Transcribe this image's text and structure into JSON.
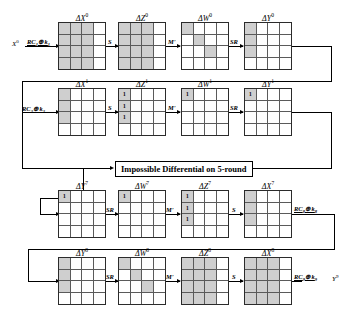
{
  "diagram": {
    "banner": "Impossible Differential on 5-round",
    "cell_mark": "1",
    "colors": {
      "active_cell": "#cfcfcf",
      "line": "#000000",
      "border": "#2b2b2b"
    },
    "rows": [
      {
        "id": "round-0",
        "input_label": "X",
        "input_sup": "0",
        "input_op": "RC",
        "input_op_sub": "1",
        "input_op_rest": "⊕ k",
        "input_op_sub2": "1",
        "states": [
          {
            "name": "delta-x-0",
            "label": "ΔX",
            "sup": "0",
            "cells": [
              [
                1,
                1,
                1,
                0
              ],
              [
                1,
                1,
                1,
                0
              ],
              [
                1,
                1,
                1,
                0
              ],
              [
                1,
                1,
                1,
                0
              ]
            ],
            "marks": [
              [
                "",
                "",
                "",
                ""
              ],
              [
                "",
                "",
                "",
                ""
              ],
              [
                "",
                "",
                "",
                ""
              ],
              [
                "",
                "",
                "",
                ""
              ]
            ]
          },
          {
            "name": "delta-z-0",
            "label": "ΔZ",
            "sup": "0",
            "cells": [
              [
                1,
                1,
                1,
                0
              ],
              [
                1,
                1,
                1,
                0
              ],
              [
                1,
                1,
                1,
                0
              ],
              [
                1,
                1,
                1,
                0
              ]
            ],
            "marks": [
              [
                "",
                "",
                "",
                ""
              ],
              [
                "",
                "",
                "",
                ""
              ],
              [
                "",
                "",
                "",
                ""
              ],
              [
                "",
                "",
                "",
                ""
              ]
            ]
          },
          {
            "name": "delta-w-0",
            "label": "ΔW",
            "sup": "0",
            "cells": [
              [
                1,
                0,
                0,
                0
              ],
              [
                0,
                1,
                0,
                0
              ],
              [
                0,
                0,
                1,
                0
              ],
              [
                0,
                0,
                0,
                0
              ]
            ],
            "marks": [
              [
                "",
                "",
                "",
                ""
              ],
              [
                "",
                "",
                "",
                ""
              ],
              [
                "",
                "",
                "",
                ""
              ],
              [
                "",
                "",
                "",
                ""
              ]
            ]
          },
          {
            "name": "delta-y-0",
            "label": "ΔY",
            "sup": "0",
            "cells": [
              [
                1,
                0,
                0,
                0
              ],
              [
                1,
                0,
                0,
                0
              ],
              [
                1,
                0,
                0,
                0
              ],
              [
                0,
                0,
                0,
                0
              ]
            ],
            "marks": [
              [
                "",
                "",
                "",
                ""
              ],
              [
                "",
                "",
                "",
                ""
              ],
              [
                "",
                "",
                "",
                ""
              ],
              [
                "",
                "",
                "",
                ""
              ]
            ]
          }
        ],
        "ops": [
          "S",
          "M'",
          "SR"
        ]
      },
      {
        "id": "round-1",
        "input_label": "",
        "input_sup": "",
        "input_op": "RC",
        "input_op_sub": "2",
        "input_op_rest": "⊕ k",
        "input_op_sub2": "2",
        "states": [
          {
            "name": "delta-x-1",
            "label": "ΔX",
            "sup": "1",
            "cells": [
              [
                1,
                0,
                0,
                0
              ],
              [
                1,
                0,
                0,
                0
              ],
              [
                1,
                0,
                0,
                0
              ],
              [
                0,
                0,
                0,
                0
              ]
            ],
            "marks": [
              [
                "",
                "",
                "",
                ""
              ],
              [
                "",
                "",
                "",
                ""
              ],
              [
                "",
                "",
                "",
                ""
              ],
              [
                "",
                "",
                "",
                ""
              ]
            ]
          },
          {
            "name": "delta-z-1",
            "label": "ΔZ",
            "sup": "1",
            "cells": [
              [
                1,
                0,
                0,
                0
              ],
              [
                1,
                0,
                0,
                0
              ],
              [
                1,
                0,
                0,
                0
              ],
              [
                0,
                0,
                0,
                0
              ]
            ],
            "marks": [
              [
                "1",
                "",
                "",
                ""
              ],
              [
                "1",
                "",
                "",
                ""
              ],
              [
                "1",
                "",
                "",
                ""
              ],
              [
                "",
                "",
                "",
                ""
              ]
            ]
          },
          {
            "name": "delta-w-1",
            "label": "ΔW",
            "sup": "1",
            "cells": [
              [
                1,
                0,
                0,
                0
              ],
              [
                0,
                0,
                0,
                0
              ],
              [
                0,
                0,
                0,
                0
              ],
              [
                0,
                0,
                0,
                0
              ]
            ],
            "marks": [
              [
                "1",
                "",
                "",
                ""
              ],
              [
                "",
                "",
                "",
                ""
              ],
              [
                "",
                "",
                "",
                ""
              ],
              [
                "",
                "",
                "",
                ""
              ]
            ]
          },
          {
            "name": "delta-y-1",
            "label": "ΔY",
            "sup": "1",
            "cells": [
              [
                1,
                0,
                0,
                0
              ],
              [
                0,
                0,
                0,
                0
              ],
              [
                0,
                0,
                0,
                0
              ],
              [
                0,
                0,
                0,
                0
              ]
            ],
            "marks": [
              [
                "1",
                "",
                "",
                ""
              ],
              [
                "",
                "",
                "",
                ""
              ],
              [
                "",
                "",
                "",
                ""
              ],
              [
                "",
                "",
                "",
                ""
              ]
            ]
          }
        ],
        "ops": [
          "S",
          "M'",
          "SR"
        ]
      },
      {
        "id": "round-7",
        "states": [
          {
            "name": "delta-y-7",
            "label": "ΔY",
            "sup": "7",
            "cells": [
              [
                1,
                0,
                0,
                0
              ],
              [
                0,
                0,
                0,
                0
              ],
              [
                0,
                0,
                0,
                0
              ],
              [
                0,
                0,
                0,
                0
              ]
            ],
            "marks": [
              [
                "1",
                "",
                "",
                ""
              ],
              [
                "",
                "",
                "",
                ""
              ],
              [
                "",
                "",
                "",
                ""
              ],
              [
                "",
                "",
                "",
                ""
              ]
            ]
          },
          {
            "name": "delta-w-7",
            "label": "ΔW",
            "sup": "7",
            "cells": [
              [
                1,
                0,
                0,
                0
              ],
              [
                0,
                0,
                0,
                0
              ],
              [
                0,
                0,
                0,
                0
              ],
              [
                0,
                0,
                0,
                0
              ]
            ],
            "marks": [
              [
                "1",
                "",
                "",
                ""
              ],
              [
                "",
                "",
                "",
                ""
              ],
              [
                "",
                "",
                "",
                ""
              ],
              [
                "",
                "",
                "",
                ""
              ]
            ]
          },
          {
            "name": "delta-z-7",
            "label": "ΔZ",
            "sup": "7",
            "cells": [
              [
                1,
                0,
                0,
                0
              ],
              [
                1,
                0,
                0,
                0
              ],
              [
                1,
                0,
                0,
                0
              ],
              [
                0,
                0,
                0,
                0
              ]
            ],
            "marks": [
              [
                "1",
                "",
                "",
                ""
              ],
              [
                "1",
                "",
                "",
                ""
              ],
              [
                "1",
                "",
                "",
                ""
              ],
              [
                "",
                "",
                "",
                ""
              ]
            ]
          },
          {
            "name": "delta-x-7",
            "label": "ΔX",
            "sup": "7",
            "cells": [
              [
                1,
                0,
                0,
                0
              ],
              [
                1,
                0,
                0,
                0
              ],
              [
                1,
                0,
                0,
                0
              ],
              [
                0,
                0,
                0,
                0
              ]
            ],
            "marks": [
              [
                "",
                "",
                "",
                ""
              ],
              [
                "",
                "",
                "",
                ""
              ],
              [
                "",
                "",
                "",
                ""
              ],
              [
                "",
                "",
                "",
                ""
              ]
            ]
          }
        ],
        "ops": [
          "SR",
          "M'",
          "S"
        ],
        "output_op": "RC",
        "output_op_sub": "8",
        "output_op_rest": "⊕ k",
        "output_op_sub2": "8"
      },
      {
        "id": "round-8",
        "states": [
          {
            "name": "delta-y-8",
            "label": "ΔY",
            "sup": "8",
            "cells": [
              [
                1,
                0,
                0,
                0
              ],
              [
                1,
                0,
                0,
                0
              ],
              [
                1,
                0,
                0,
                0
              ],
              [
                0,
                0,
                0,
                0
              ]
            ],
            "marks": [
              [
                "",
                "",
                "",
                ""
              ],
              [
                "",
                "",
                "",
                ""
              ],
              [
                "",
                "",
                "",
                ""
              ],
              [
                "",
                "",
                "",
                ""
              ]
            ]
          },
          {
            "name": "delta-w-8",
            "label": "ΔW",
            "sup": "8",
            "cells": [
              [
                1,
                0,
                0,
                0
              ],
              [
                0,
                1,
                0,
                0
              ],
              [
                0,
                0,
                1,
                0
              ],
              [
                0,
                0,
                0,
                0
              ]
            ],
            "marks": [
              [
                "",
                "",
                "",
                ""
              ],
              [
                "",
                "",
                "",
                ""
              ],
              [
                "",
                "",
                "",
                ""
              ],
              [
                "",
                "",
                "",
                ""
              ]
            ]
          },
          {
            "name": "delta-z-8",
            "label": "ΔZ",
            "sup": "8",
            "cells": [
              [
                1,
                1,
                1,
                0
              ],
              [
                1,
                1,
                1,
                0
              ],
              [
                1,
                1,
                1,
                0
              ],
              [
                1,
                1,
                1,
                0
              ]
            ],
            "marks": [
              [
                "",
                "",
                "",
                ""
              ],
              [
                "",
                "",
                "",
                ""
              ],
              [
                "",
                "",
                "",
                ""
              ],
              [
                "",
                "",
                "",
                ""
              ]
            ]
          },
          {
            "name": "delta-x-8",
            "label": "ΔX",
            "sup": "8",
            "cells": [
              [
                1,
                1,
                1,
                0
              ],
              [
                1,
                1,
                1,
                0
              ],
              [
                1,
                1,
                1,
                0
              ],
              [
                1,
                1,
                1,
                0
              ]
            ],
            "marks": [
              [
                "",
                "",
                "",
                ""
              ],
              [
                "",
                "",
                "",
                ""
              ],
              [
                "",
                "",
                "",
                ""
              ],
              [
                "",
                "",
                "",
                ""
              ]
            ]
          }
        ],
        "ops": [
          "SR",
          "M'",
          "S"
        ],
        "output_op": "RC",
        "output_op_sub": "9",
        "output_op_rest": "⊕ k",
        "output_op_sub2": "9",
        "output_label": "Y",
        "output_sup": "9"
      }
    ]
  }
}
